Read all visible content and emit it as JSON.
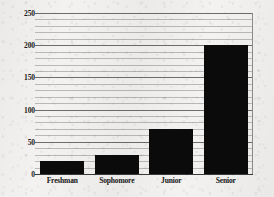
{
  "chart_data": {
    "type": "bar",
    "title": "",
    "xlabel": "",
    "ylabel": "",
    "categories": [
      "Freshman",
      "Sophomore",
      "Junior",
      "Senior"
    ],
    "values": [
      20,
      30,
      70,
      200
    ],
    "ylim": [
      0,
      250
    ],
    "y_major_ticks": [
      0,
      50,
      100,
      150,
      200,
      250
    ],
    "y_minor_tick_step": 10,
    "grid": true,
    "legend": null,
    "bar_color": "#0b0b0b",
    "background_color": "#f3f2f0",
    "gridline_color": "#9a9a9a",
    "axis_color": "#3a3a3a"
  },
  "axes": {
    "y_tick_labels": [
      "250",
      "200",
      "150",
      "100",
      "50",
      "0"
    ],
    "x_tick_labels": [
      "Freshman",
      "Sophomore",
      "Junior",
      "Senior"
    ]
  }
}
